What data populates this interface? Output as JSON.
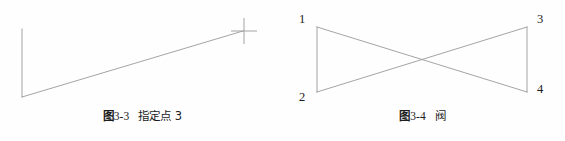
{
  "document": {
    "background_color": "#fefefe",
    "line_color": "#9a9a9a",
    "text_color": "#1c1c1c"
  },
  "figures": [
    {
      "id": "figure-3-3",
      "caption": {
        "tag": "图",
        "number": "3-3",
        "title": "指定点 3",
        "full": "图 3-3  指定点 3"
      },
      "drawing": {
        "type": "polyline-with-crosshair",
        "stroke_color": "#9a9a9a",
        "stroke_width": 0.9,
        "viewbox": "0 0 285 105",
        "points": [
          {
            "name": "point-1",
            "x": 22,
            "y": 29
          },
          {
            "name": "point-2",
            "x": 22,
            "y": 97
          },
          {
            "name": "point-3",
            "x": 243,
            "y": 31
          }
        ],
        "cursor": {
          "name": "crosshair-cursor",
          "x": 244,
          "y": 31,
          "arm_length": 13
        }
      },
      "vertex_labels": []
    },
    {
      "id": "figure-3-4",
      "caption": {
        "tag": "图",
        "number": "3-4",
        "title": "阀",
        "full": "图 3-4  阀"
      },
      "drawing": {
        "type": "bowtie-valve",
        "stroke_color": "#9a9a9a",
        "stroke_width": 0.9,
        "viewbox": "0 0 285 105",
        "points": [
          {
            "name": "vertex-1",
            "x": 37,
            "y": 27
          },
          {
            "name": "vertex-2",
            "x": 37,
            "y": 92
          },
          {
            "name": "vertex-3",
            "x": 247,
            "y": 27
          },
          {
            "name": "vertex-4",
            "x": 247,
            "y": 92
          }
        ],
        "segments": [
          {
            "name": "left-edge",
            "from": "vertex-1",
            "to": "vertex-2"
          },
          {
            "name": "right-edge",
            "from": "vertex-3",
            "to": "vertex-4"
          },
          {
            "name": "upper-diagonal",
            "from": "vertex-1",
            "to": "vertex-4"
          },
          {
            "name": "lower-diagonal",
            "from": "vertex-2",
            "to": "vertex-3"
          }
        ]
      },
      "vertex_labels": [
        {
          "name": "vertex-label-1",
          "text": "1",
          "left": 19,
          "top": 13
        },
        {
          "name": "vertex-label-2",
          "text": "2",
          "left": 19,
          "top": 91
        },
        {
          "name": "vertex-label-3",
          "text": "3",
          "left": 257,
          "top": 13
        },
        {
          "name": "vertex-label-4",
          "text": "4",
          "left": 257,
          "top": 83
        }
      ]
    }
  ]
}
